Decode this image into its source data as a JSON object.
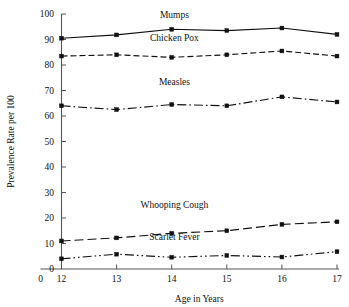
{
  "chart_data": {
    "type": "line",
    "title": "",
    "xlabel": "Age in Years",
    "ylabel": "Prevalence Rate per 100",
    "x": [
      12,
      13,
      14,
      15,
      16,
      17
    ],
    "xtick_labels": [
      "12",
      "13",
      "14",
      "15",
      "16",
      "17"
    ],
    "x_origin_label": "0",
    "xlim": [
      12,
      17
    ],
    "ylim": [
      0,
      100
    ],
    "ytick_labels": [
      "0",
      "10",
      "20",
      "30",
      "40",
      "50",
      "60",
      "70",
      "80",
      "90",
      "100"
    ],
    "yticks": [
      0,
      10,
      20,
      30,
      40,
      50,
      60,
      70,
      80,
      90,
      100
    ],
    "grid": false,
    "legend_position": "inline-labels",
    "marker": "square",
    "series": [
      {
        "name": "Mumps",
        "line_style": "solid",
        "values": [
          90.5,
          91.8,
          94.0,
          93.5,
          94.5,
          92.0
        ],
        "label_x": 14.05,
        "label_y": 98.5
      },
      {
        "name": "Chicken Pox",
        "line_style": "dashed",
        "values": [
          83.5,
          84.0,
          83.0,
          84.0,
          85.5,
          83.5
        ],
        "label_x": 14.05,
        "label_y": 89.5
      },
      {
        "name": "Measles",
        "line_style": "dash-dot",
        "values": [
          64.0,
          62.5,
          64.5,
          64.0,
          67.5,
          65.5
        ],
        "label_x": 14.05,
        "label_y": 72.0
      },
      {
        "name": "Whooping Cough",
        "line_style": "long-dash",
        "values": [
          11.0,
          12.2,
          14.0,
          15.0,
          17.5,
          18.5
        ],
        "label_x": 14.05,
        "label_y": 24.0
      },
      {
        "name": "Scarlet Fever",
        "line_style": "dash-dot-dot",
        "values": [
          4.0,
          5.8,
          4.6,
          5.3,
          4.7,
          6.8
        ],
        "label_x": 14.05,
        "label_y": 11.5
      }
    ]
  },
  "colors": {
    "line": "#111111",
    "axis": "#555555",
    "background": "#ffffff"
  }
}
